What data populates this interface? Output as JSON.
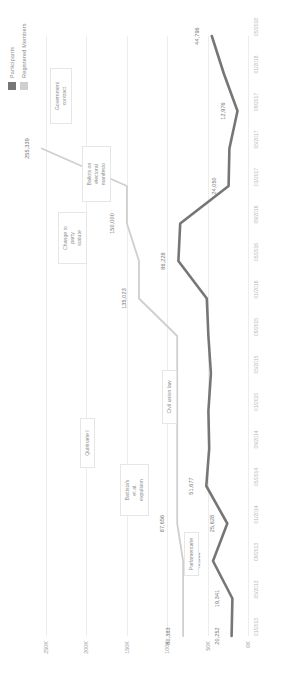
{
  "legend": {
    "items": [
      {
        "label": "Participants",
        "color": "#767676",
        "name": "legend-participants"
      },
      {
        "label": "Registered Members",
        "color": "#cfcfcf",
        "name": "legend-registered-members"
      }
    ]
  },
  "chart_data": {
    "type": "line",
    "title": "",
    "xlabel": "",
    "ylabel": "",
    "ylim": [
      0,
      265000
    ],
    "yticks": [
      0,
      50000,
      100000,
      150000,
      200000,
      250000
    ],
    "ytick_labels": [
      "0K",
      "50K",
      "100K",
      "150K",
      "200K",
      "250K"
    ],
    "grid": true,
    "legend_position": "top-right",
    "categories": [
      "01/2013",
      "05/2013",
      "09/2013",
      "01/2014",
      "05/2014",
      "09/2014",
      "01/2015",
      "05/2015",
      "09/2015",
      "01/2016",
      "05/2016",
      "09/2016",
      "01/2017",
      "05/2017",
      "09/2017",
      "01/2018",
      "05/2018"
    ],
    "series": [
      {
        "name": "Participants",
        "color": "#767676",
        "values": [
          20252,
          19341,
          43368,
          25628,
          51677,
          48000,
          49000,
          46000,
          49000,
          51000,
          86228,
          84000,
          24050,
          23000,
          12976,
          30000,
          44796
        ],
        "labels": [
          {
            "index": 0,
            "text": "20,252"
          },
          {
            "index": 1,
            "text": "19,341"
          },
          {
            "index": 2,
            "text": "43,368"
          },
          {
            "index": 3,
            "text": "25,628"
          },
          {
            "index": 4,
            "text": "51,677"
          },
          {
            "index": 10,
            "text": "86,228"
          },
          {
            "index": 12,
            "text": "24,050"
          },
          {
            "index": 14,
            "text": "12,976"
          },
          {
            "index": 16,
            "text": "44,796"
          }
        ]
      },
      {
        "name": "Registered Members",
        "color": "#cfcfcf",
        "values": [
          80383,
          80383,
          80383,
          87656,
          87656,
          87656,
          87656,
          87656,
          87656,
          135023,
          135023,
          150000,
          150000,
          255339,
          null,
          null,
          null
        ],
        "labels": [
          {
            "index": 0,
            "text": "80,383"
          },
          {
            "index": 3,
            "text": "87,656"
          },
          {
            "index": 9,
            "text": "135,023"
          },
          {
            "index": 11,
            "text": "150,000"
          },
          {
            "index": 13,
            "text": "255,339"
          }
        ]
      }
    ],
    "annotations": [
      {
        "text": "Parlamentarie",
        "name": "annotation-parlamentarie"
      },
      {
        "text": "Battista's\net al.\nexpulsion",
        "name": "annotation-battista-expulsion"
      },
      {
        "text": "Quirinarie I",
        "name": "annotation-quirinarie-i"
      },
      {
        "text": "Civil union law",
        "name": "annotation-civil-union-law"
      },
      {
        "text": "Change to\nparty\nstatute",
        "name": "annotation-change-party-statute"
      },
      {
        "text": "Ballots on\nelectoral\nmanifesto",
        "name": "annotation-ballots-electoral-manifesto"
      },
      {
        "text": "Government\ncontract",
        "name": "annotation-government-contract"
      }
    ]
  }
}
